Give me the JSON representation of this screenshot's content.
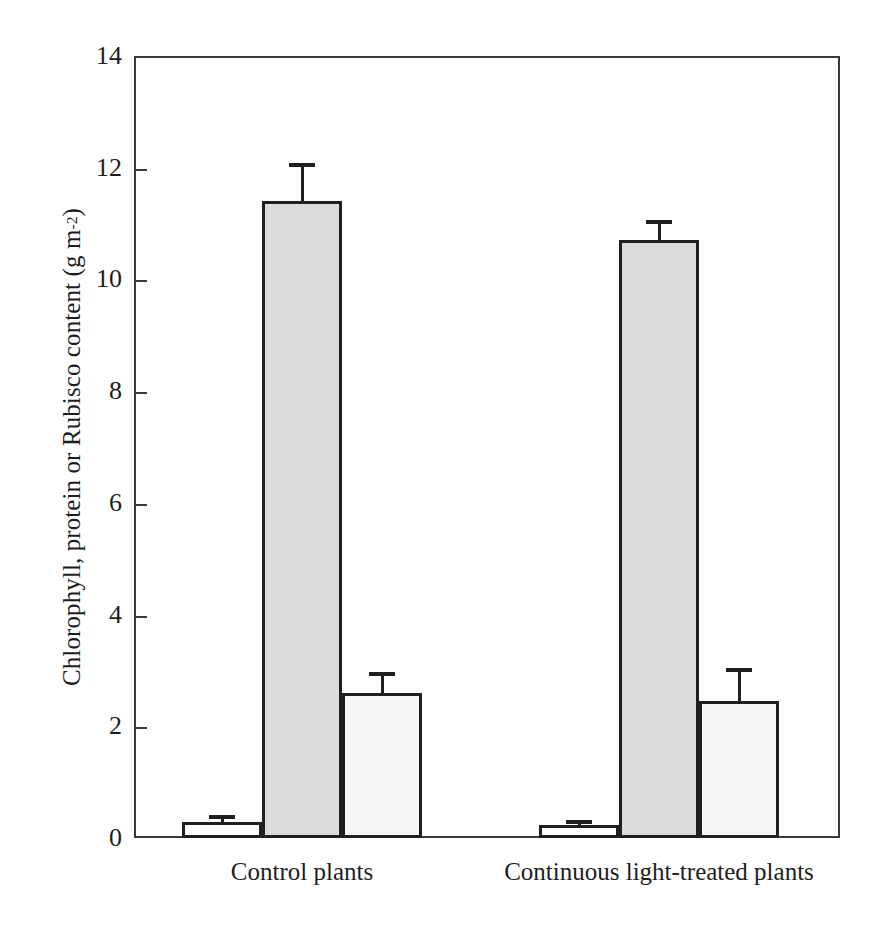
{
  "chart_data": {
    "type": "bar",
    "title": "",
    "xlabel": "",
    "ylabel": "Chlorophyll, protein or Rubisco content (g m",
    "ylabel_sup": "-2",
    "ylabel_suffix": ")",
    "categories": [
      "Control plants",
      "Continuous light-treated plants"
    ],
    "series": [
      {
        "name": "Chlorophyll",
        "fill": "white",
        "values": [
          0.29,
          0.23
        ],
        "errors": [
          0.08,
          0.06
        ]
      },
      {
        "name": "Protein",
        "fill": "gray",
        "values": [
          11.4,
          10.7
        ],
        "errors": [
          0.65,
          0.33
        ]
      },
      {
        "name": "Rubisco",
        "fill": "light",
        "values": [
          2.6,
          2.45
        ],
        "errors": [
          0.33,
          0.55
        ]
      }
    ],
    "ylim": [
      0,
      14
    ],
    "yticks": [
      0,
      2,
      4,
      6,
      8,
      10,
      12,
      14
    ],
    "ytick_labels": [
      "0",
      "2",
      "4",
      "6",
      "8",
      "10",
      "12",
      "14"
    ],
    "grid": false,
    "legend": "none",
    "error_bar_style": "upper-only",
    "colors": {
      "axis": "#3a3a3a",
      "bar_outline": "#1f1f1f",
      "fill_white": "#ffffff",
      "fill_gray": "#dcdcdc",
      "fill_light": "#f6f6f6",
      "text": "#1d1d1d"
    }
  }
}
